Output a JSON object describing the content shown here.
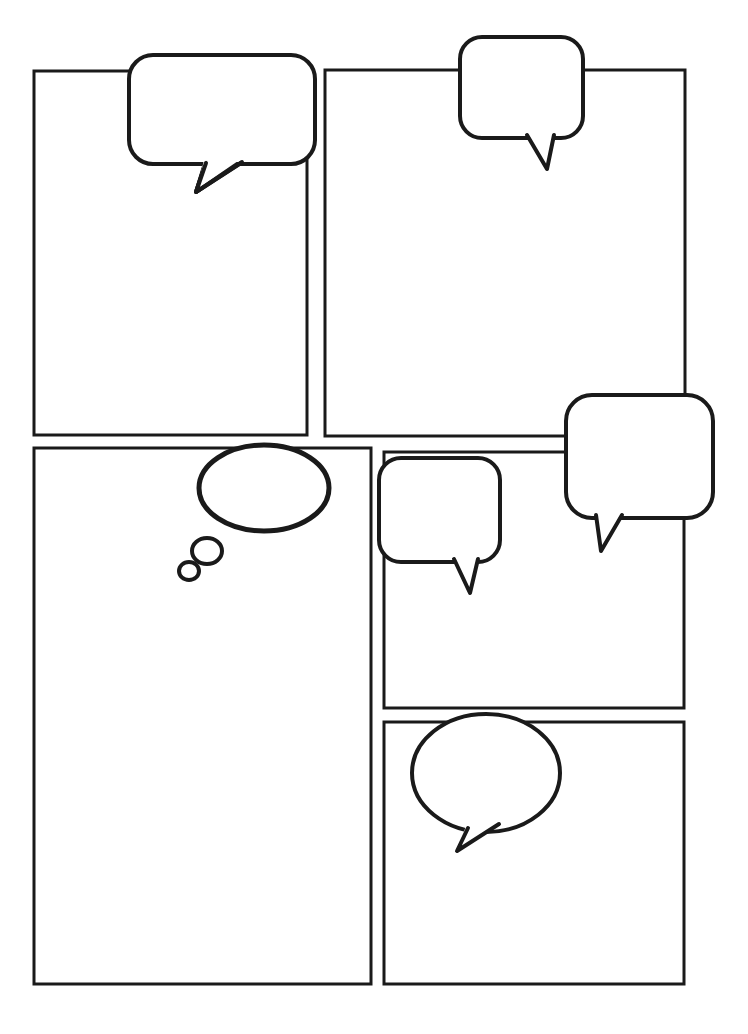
{
  "page": {
    "width": 748,
    "height": 1034,
    "background_color": "#ffffff",
    "ink_color": "#1a1a1a"
  },
  "panels": [
    {
      "id": "panel-1",
      "label": "",
      "x": 34,
      "y": 71,
      "width": 273,
      "height": 364,
      "stroke_width": 3
    },
    {
      "id": "panel-2",
      "label": "",
      "x": 325,
      "y": 70,
      "width": 360,
      "height": 366,
      "stroke_width": 3
    },
    {
      "id": "panel-3",
      "label": "",
      "x": 34,
      "y": 448,
      "width": 337,
      "height": 536,
      "stroke_width": 3
    },
    {
      "id": "panel-4",
      "label": "",
      "x": 384,
      "y": 452,
      "width": 300,
      "height": 256,
      "stroke_width": 3
    },
    {
      "id": "panel-5",
      "label": "",
      "x": 384,
      "y": 722,
      "width": 300,
      "height": 262,
      "stroke_width": 3
    }
  ],
  "balloons": [
    {
      "id": "balloon-1",
      "kind": "speech-rounded",
      "label": "",
      "x": 129,
      "y": 55,
      "width": 186,
      "height": 109,
      "corner_radius": 24,
      "stroke_width": 4,
      "tail": "M 206 160 L 196 192 L 240 161 Z"
    },
    {
      "id": "balloon-2",
      "kind": "speech-rounded",
      "label": "",
      "x": 460,
      "y": 37,
      "width": 123,
      "height": 101,
      "corner_radius": 22,
      "stroke_width": 4,
      "tail": "M 528 134 L 547 170 L 553 134 Z"
    },
    {
      "id": "balloon-3",
      "kind": "speech-rounded",
      "label": "",
      "x": 566,
      "y": 395,
      "width": 147,
      "height": 123,
      "corner_radius": 26,
      "stroke_width": 4,
      "tail": "M 597 514 L 601 550 L 620 514 Z"
    },
    {
      "id": "balloon-4",
      "kind": "speech-rounded",
      "label": "",
      "x": 379,
      "y": 458,
      "width": 121,
      "height": 104,
      "corner_radius": 22,
      "stroke_width": 4,
      "tail": "M 455 558 L 470 592 L 476 558 Z"
    },
    {
      "id": "balloon-5",
      "kind": "speech-oval",
      "label": "",
      "cx": 486,
      "cy": 773,
      "rx": 74,
      "ry": 59,
      "stroke_width": 4,
      "tail": "M 470 828 L 458 851 L 497 825 Z"
    }
  ],
  "thought_bubbles": [
    {
      "id": "thought-1",
      "kind": "thought-cloud",
      "label": "",
      "main": {
        "cx": 264,
        "cy": 488,
        "rx": 65,
        "ry": 43,
        "stroke_width": 5
      },
      "puffs": [
        {
          "cx": 207,
          "cy": 551,
          "rx": 15,
          "ry": 13,
          "stroke_width": 4
        },
        {
          "cx": 189,
          "cy": 571,
          "rx": 10,
          "ry": 9,
          "stroke_width": 4
        }
      ]
    }
  ]
}
